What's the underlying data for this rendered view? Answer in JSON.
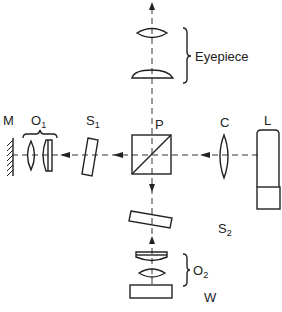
{
  "diagram": {
    "type": "optical-schematic",
    "labels": {
      "mirror": "M",
      "objective1": "O",
      "objective1_sub": "1",
      "sample1": "S",
      "sample1_sub": "1",
      "beamsplitter": "P",
      "condenser": "C",
      "lamp": "L",
      "eyepiece": "Eyepiece",
      "sample2": "S",
      "sample2_sub": "2",
      "objective2": "O",
      "objective2_sub": "2",
      "workpiece": "W"
    },
    "colors": {
      "line": "#222222",
      "background": "#ffffff"
    },
    "components": [
      {
        "id": "M",
        "kind": "mirror",
        "axis": "horizontal"
      },
      {
        "id": "O1",
        "kind": "objective-lens-pair",
        "axis": "horizontal"
      },
      {
        "id": "S1",
        "kind": "tilted-plate",
        "axis": "horizontal"
      },
      {
        "id": "P",
        "kind": "beam-splitter-cube"
      },
      {
        "id": "C",
        "kind": "condenser-lens",
        "axis": "horizontal"
      },
      {
        "id": "L",
        "kind": "lamp"
      },
      {
        "id": "Eyepiece",
        "kind": "lens-pair",
        "axis": "vertical"
      },
      {
        "id": "S2",
        "kind": "tilted-plate",
        "axis": "vertical"
      },
      {
        "id": "O2",
        "kind": "objective-lens-pair",
        "axis": "vertical"
      },
      {
        "id": "W",
        "kind": "workpiece",
        "axis": "vertical"
      }
    ],
    "edges": [
      {
        "from": "L",
        "to": "C",
        "direction": "left"
      },
      {
        "from": "C",
        "to": "P",
        "direction": "left"
      },
      {
        "from": "P",
        "to": "S1",
        "direction": "left"
      },
      {
        "from": "S1",
        "to": "O1",
        "direction": "left"
      },
      {
        "from": "O1",
        "to": "M",
        "direction": "left"
      },
      {
        "from": "P",
        "to": "S2",
        "direction": "down"
      },
      {
        "from": "O2",
        "to": "S2",
        "direction": "up"
      },
      {
        "from": "P",
        "to": "Eyepiece",
        "direction": "up"
      }
    ]
  }
}
